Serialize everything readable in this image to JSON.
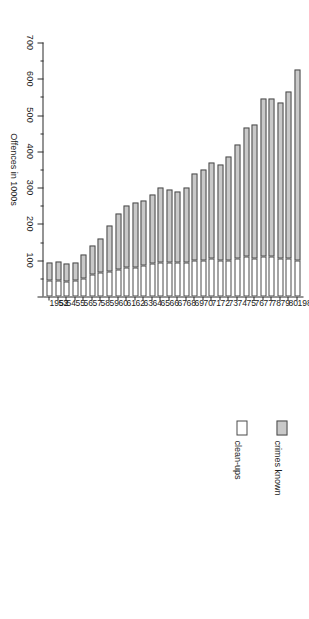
{
  "figure": {
    "value_axis_title": "Offences in 1000s",
    "value_axis_ticks": [
      0,
      100,
      200,
      300,
      400,
      500,
      600,
      700
    ],
    "value_axis_tick_labels": [
      "",
      "100",
      "200",
      "300",
      "400",
      "500",
      "600",
      "700"
    ],
    "minor_tick_interval": 50,
    "legend": {
      "items": [
        {
          "label": "crimes known",
          "color": "#c9c9c9",
          "swatch": "filled-gray-swatch"
        },
        {
          "label": "clean-ups",
          "color": "#ffffff",
          "swatch": "empty-white-swatch"
        }
      ]
    }
  },
  "chart_data": {
    "type": "bar",
    "orientation": "horizontal",
    "stacked": false,
    "overlay": "clean-ups drawn as the white remainder from the baseline; crimes known is the gray outer segment",
    "title": "",
    "subtitle": "",
    "xlabel": "Offences in 1000s",
    "ylabel": "",
    "xlim": [
      0,
      700
    ],
    "grid": false,
    "legend_position": "inside-left",
    "categories": [
      "1952",
      "53",
      "54",
      "55",
      "56",
      "57",
      "58",
      "59",
      "60",
      "61",
      "62",
      "63",
      "64",
      "65",
      "66",
      "67",
      "68",
      "69",
      "70",
      "71",
      "72",
      "73",
      "74",
      "75",
      "76",
      "77",
      "78",
      "79",
      "80",
      "1981"
    ],
    "series": [
      {
        "name": "crimes known",
        "values": [
          95,
          97,
          90,
          95,
          115,
          140,
          160,
          195,
          230,
          250,
          260,
          265,
          280,
          300,
          295,
          290,
          300,
          340,
          350,
          370,
          365,
          385,
          420,
          465,
          475,
          545,
          545,
          535,
          565,
          625
        ]
      },
      {
        "name": "clean-ups",
        "values": [
          45,
          45,
          42,
          45,
          50,
          60,
          65,
          70,
          75,
          80,
          80,
          85,
          90,
          95,
          95,
          95,
          95,
          100,
          100,
          105,
          100,
          100,
          105,
          110,
          105,
          110,
          110,
          105,
          105,
          100
        ]
      }
    ]
  }
}
